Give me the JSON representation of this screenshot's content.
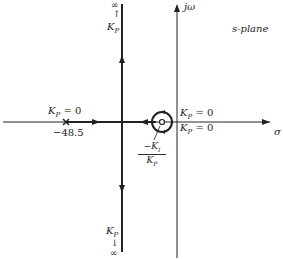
{
  "title": "s-plane",
  "axes": {
    "real_label": "σ",
    "imag_label": "jω"
  },
  "annotations": {
    "top_infinity": "∞",
    "top_arrow": "↑",
    "top_kp": "K",
    "kp_sub": "P",
    "bottom_kp": "K",
    "bottom_arrow": "↓",
    "bottom_infinity": "∞",
    "pole_label": "K",
    "pole_eq": " = 0",
    "pole_value": "−48.5",
    "upper_right_label": "K",
    "upper_right_eq": " = 0",
    "lower_right_label": "K",
    "lower_right_eq": " = 0",
    "zero_num": "−K",
    "zero_num_sub": "I",
    "zero_den": "K",
    "zero_den_sub": "P"
  }
}
